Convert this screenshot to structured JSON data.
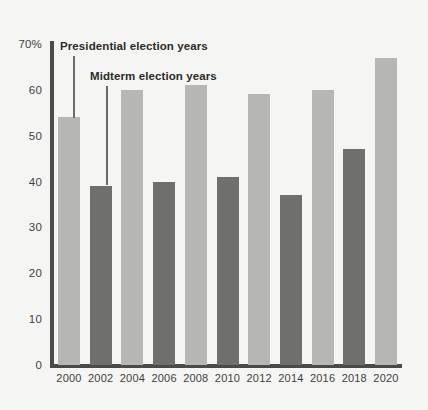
{
  "chart_data": {
    "type": "bar",
    "title": "",
    "subtitle": "",
    "xlabel": "",
    "ylabel": "",
    "ylim": [
      0,
      70
    ],
    "grid": false,
    "legend_position": "none",
    "categories": [
      "2000",
      "2002",
      "2004",
      "2006",
      "2008",
      "2010",
      "2012",
      "2014",
      "2016",
      "2018",
      "2020"
    ],
    "values": [
      54,
      39,
      60,
      40,
      61,
      41,
      59,
      37,
      60,
      47,
      67
    ],
    "series": [
      {
        "name": "Presidential election years",
        "color": "#b6b6b4",
        "points": [
          {
            "x": "2000",
            "y": 54
          },
          {
            "x": "2004",
            "y": 60
          },
          {
            "x": "2008",
            "y": 61
          },
          {
            "x": "2012",
            "y": 59
          },
          {
            "x": "2016",
            "y": 60
          },
          {
            "x": "2020",
            "y": 67
          }
        ]
      },
      {
        "name": "Midterm election years",
        "color": "#6f6f6d",
        "points": [
          {
            "x": "2002",
            "y": 39
          },
          {
            "x": "2006",
            "y": 40
          },
          {
            "x": "2010",
            "y": 41
          },
          {
            "x": "2014",
            "y": 37
          },
          {
            "x": "2018",
            "y": 47
          }
        ]
      }
    ],
    "bar_kinds": [
      "presidential",
      "midterm",
      "presidential",
      "midterm",
      "presidential",
      "midterm",
      "presidential",
      "midterm",
      "presidential",
      "midterm",
      "presidential"
    ],
    "yticks": [
      {
        "value": 70,
        "label": "70%"
      },
      {
        "value": 60,
        "label": "60"
      },
      {
        "value": 50,
        "label": "50"
      },
      {
        "value": 40,
        "label": "40"
      },
      {
        "value": 30,
        "label": "30"
      },
      {
        "value": 20,
        "label": "20"
      },
      {
        "value": 10,
        "label": "10"
      },
      {
        "value": 0,
        "label": "0"
      }
    ],
    "xticks": [
      "2000",
      "2002",
      "2004",
      "2006",
      "2008",
      "2010",
      "2012",
      "2014",
      "2016",
      "2018",
      "2020"
    ],
    "annotations": [
      {
        "id": "presidential",
        "text": "Presidential election years"
      },
      {
        "id": "midterm",
        "text": "Midterm election years"
      }
    ]
  },
  "colors": {
    "background": "#f5f5f3",
    "axis": "#4a4a48",
    "presidential_bar": "#b6b6b4",
    "midterm_bar": "#6f6f6d",
    "tick_text": "#3f3f3d",
    "annotation_text": "#2b2b29",
    "leader_line": "#6b6b69"
  }
}
